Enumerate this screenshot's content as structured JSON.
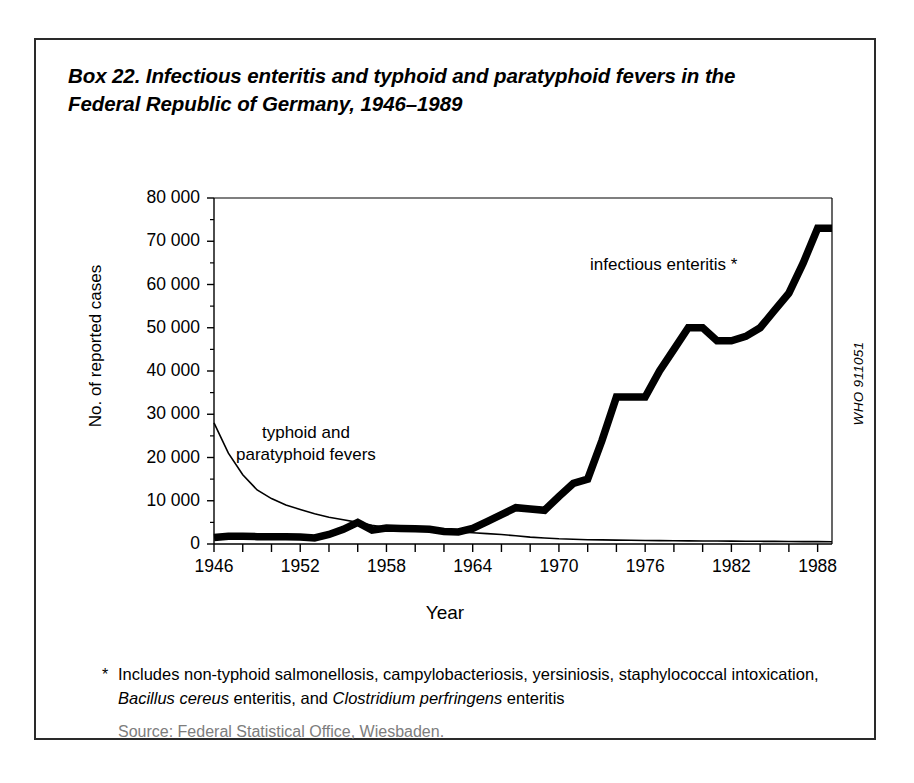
{
  "box": {
    "title": "Box 22. Infectious enteritis and typhoid and paratyphoid fevers in the Federal Republic of Germany, 1946–1989",
    "who_code": "WHO 911051",
    "footnote_marker": "*",
    "footnote_part1": "Includes non-typhoid salmonellosis, campylobacteriosis, yersiniosis, staphylococcal intoxication, ",
    "footnote_italic1": "Bacillus cereus",
    "footnote_part2": " enteritis, and ",
    "footnote_italic2": "Clostridium perfringens",
    "footnote_part3": " enteritis",
    "source": "Source: Federal Statistical Office, Wiesbaden."
  },
  "annotations": {
    "enteritis": "infectious enteritis *",
    "typhoid": "typhoid and\nparatyphoid fevers"
  },
  "chart_data": {
    "type": "line",
    "title": "Box 22. Infectious enteritis and typhoid and paratyphoid fevers in the Federal Republic of Germany, 1946–1989",
    "xlabel": "Year",
    "ylabel": "No. of reported cases",
    "xlim": [
      1946,
      1989
    ],
    "ylim": [
      0,
      80000
    ],
    "ytick_values": [
      0,
      10000,
      20000,
      30000,
      40000,
      50000,
      60000,
      70000,
      80000
    ],
    "ytick_labels": [
      "0",
      "10 000",
      "20 000",
      "30 000",
      "40 000",
      "50 000",
      "60 000",
      "70 000",
      "80 000"
    ],
    "xtick_values": [
      1946,
      1948,
      1950,
      1952,
      1954,
      1956,
      1958,
      1960,
      1962,
      1964,
      1966,
      1968,
      1970,
      1972,
      1974,
      1976,
      1978,
      1980,
      1982,
      1984,
      1986,
      1988
    ],
    "xtick_labels_shown": [
      "1946",
      "1952",
      "1958",
      "1964",
      "1970",
      "1976",
      "1982",
      "1988"
    ],
    "xtick_labeled_values": [
      1946,
      1952,
      1958,
      1964,
      1970,
      1976,
      1982,
      1988
    ],
    "grid": false,
    "legend": "in-plot annotations",
    "line_colors": {
      "infectious_enteritis": "#000000",
      "typhoid_paratyphoid": "#000000"
    },
    "x": [
      1946,
      1947,
      1948,
      1949,
      1950,
      1951,
      1952,
      1953,
      1954,
      1955,
      1956,
      1957,
      1958,
      1959,
      1960,
      1961,
      1962,
      1963,
      1964,
      1965,
      1966,
      1967,
      1968,
      1969,
      1970,
      1971,
      1972,
      1973,
      1974,
      1975,
      1976,
      1977,
      1978,
      1979,
      1980,
      1981,
      1982,
      1983,
      1984,
      1985,
      1986,
      1987,
      1988,
      1989
    ],
    "series": [
      {
        "name": "infectious enteritis *",
        "line_width": "thick",
        "values": [
          1500,
          1800,
          1800,
          1700,
          1700,
          1700,
          1600,
          1400,
          2200,
          3400,
          5000,
          3200,
          3700,
          3600,
          3500,
          3400,
          2900,
          2800,
          3600,
          5200,
          6800,
          8400,
          8100,
          7800,
          11000,
          14000,
          15000,
          24000,
          34000,
          34000,
          34000,
          40000,
          45000,
          50000,
          50000,
          47000,
          47000,
          48000,
          50000,
          54000,
          58000,
          65000,
          73000,
          73000
        ]
      },
      {
        "name": "typhoid and paratyphoid fevers",
        "line_width": "thin",
        "values": [
          28000,
          21000,
          16000,
          12500,
          10500,
          9000,
          8000,
          7000,
          6200,
          5600,
          5000,
          4300,
          3800,
          3600,
          3400,
          3200,
          3000,
          2800,
          2600,
          2400,
          2200,
          1900,
          1600,
          1400,
          1200,
          1100,
          1000,
          950,
          900,
          850,
          800,
          780,
          750,
          720,
          700,
          680,
          660,
          640,
          620,
          600,
          580,
          560,
          540,
          520
        ]
      }
    ]
  }
}
